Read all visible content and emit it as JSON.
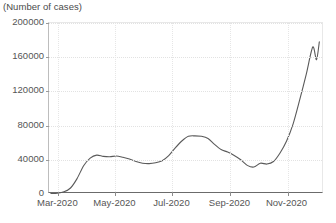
{
  "chart_data": {
    "type": "line",
    "title": "(Number of cases)",
    "xlabel": "",
    "ylabel": "(Number of cases)",
    "grid": true,
    "legend": "none",
    "ylim": [
      0,
      200000
    ],
    "yticks": [
      0,
      40000,
      80000,
      120000,
      160000,
      200000
    ],
    "ytick_labels": [
      "0",
      "40000",
      "80000",
      "120000",
      "160000",
      "200000"
    ],
    "xtick_labels": [
      "Mar-2020",
      "May-2020",
      "Jul-2020",
      "Sep-2020",
      "Nov-2020"
    ],
    "xtick_positions": [
      "2020-03-01",
      "2020-05-01",
      "2020-07-01",
      "2020-09-01",
      "2020-11-01"
    ],
    "xlim": [
      "2020-02-20",
      "2020-12-10"
    ],
    "series": [
      {
        "name": "Number of cases",
        "color": "#5a5a5a",
        "line_width": 1.1,
        "x": [
          "2020-02-22",
          "2020-02-29",
          "2020-03-07",
          "2020-03-14",
          "2020-03-21",
          "2020-03-28",
          "2020-04-04",
          "2020-04-11",
          "2020-04-18",
          "2020-04-25",
          "2020-05-02",
          "2020-05-09",
          "2020-05-16",
          "2020-05-23",
          "2020-05-30",
          "2020-06-06",
          "2020-06-13",
          "2020-06-20",
          "2020-06-27",
          "2020-07-04",
          "2020-07-11",
          "2020-07-18",
          "2020-07-25",
          "2020-08-01",
          "2020-08-08",
          "2020-08-15",
          "2020-08-22",
          "2020-08-29",
          "2020-09-05",
          "2020-09-12",
          "2020-09-19",
          "2020-09-26",
          "2020-10-03",
          "2020-10-10",
          "2020-10-17",
          "2020-10-24",
          "2020-10-31",
          "2020-11-07",
          "2020-11-14",
          "2020-11-21",
          "2020-11-28",
          "2020-12-02",
          "2020-12-05"
        ],
        "values": [
          500,
          900,
          2500,
          7000,
          18000,
          33000,
          42000,
          45500,
          44000,
          43500,
          44500,
          43000,
          41000,
          38000,
          36000,
          35500,
          36500,
          39000,
          45000,
          54000,
          62000,
          67500,
          68000,
          67500,
          65000,
          58000,
          52000,
          49000,
          45000,
          40000,
          33500,
          31500,
          36000,
          35000,
          38000,
          48000,
          62000,
          82000,
          110000,
          140000,
          172000,
          157000,
          178000
        ]
      }
    ]
  }
}
